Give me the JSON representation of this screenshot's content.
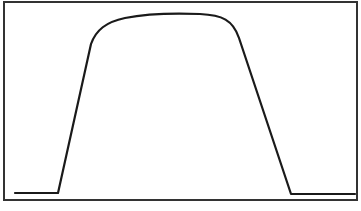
{
  "figure": {
    "frame": {
      "x": 4,
      "y": 2,
      "width": 353,
      "height": 198,
      "stroke": "#333333",
      "stroke_width": 2
    },
    "waveform": {
      "stroke": "#1a1a1a",
      "stroke_width": 2.2,
      "path": "M 15 193 L 58 193 L 91 44 C 96 30, 106 22, 125 18 C 145 14, 175 13, 200 14 C 222 15, 233 20, 239 38 L 291 194 L 355 194",
      "segments": [
        {
          "name": "baseline-left",
          "from": [
            15,
            193
          ],
          "to": [
            58,
            193
          ]
        },
        {
          "name": "rising-edge",
          "from": [
            58,
            193
          ],
          "to": [
            91,
            44
          ]
        },
        {
          "name": "rounded-top",
          "from": [
            91,
            44
          ],
          "to": [
            239,
            38
          ],
          "peak_y": 13
        },
        {
          "name": "falling-edge",
          "from": [
            239,
            38
          ],
          "to": [
            291,
            194
          ]
        },
        {
          "name": "baseline-right",
          "from": [
            291,
            194
          ],
          "to": [
            355,
            194
          ]
        }
      ]
    },
    "background": "#ffffff"
  }
}
